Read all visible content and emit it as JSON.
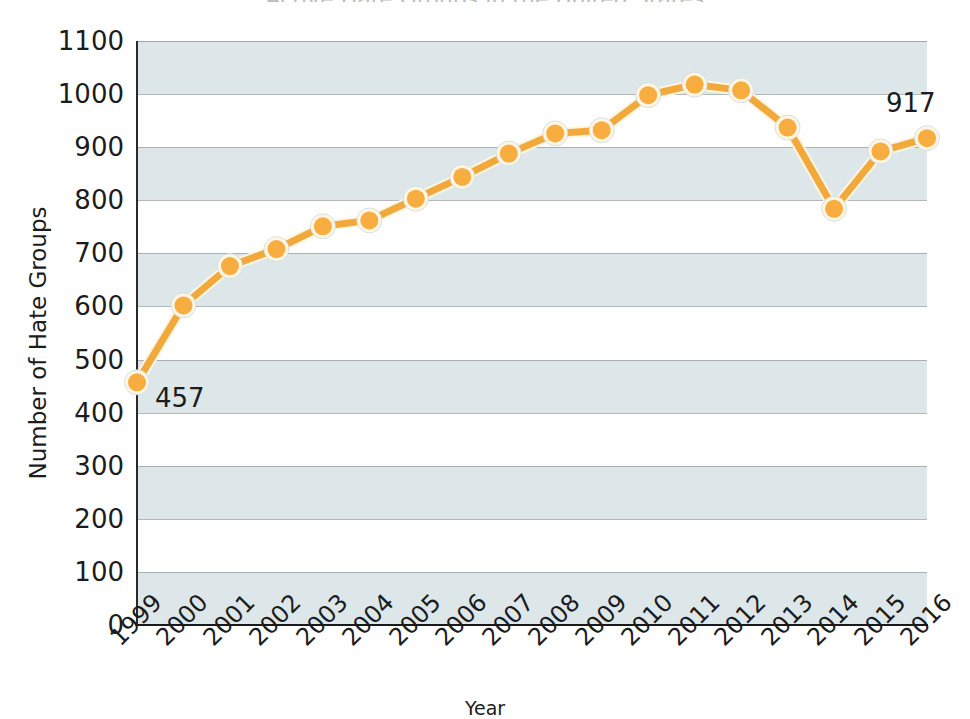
{
  "chart_data": {
    "type": "line",
    "title": "Active Hate Groups in the United States",
    "xlabel": "Year",
    "ylabel": "Number of Hate Groups",
    "categories": [
      "1999",
      "2000",
      "2001",
      "2002",
      "2003",
      "2004",
      "2005",
      "2006",
      "2007",
      "2008",
      "2009",
      "2010",
      "2011",
      "2012",
      "2013",
      "2014",
      "2015",
      "2016"
    ],
    "values": [
      457,
      602,
      676,
      708,
      751,
      762,
      803,
      844,
      888,
      926,
      932,
      998,
      1018,
      1007,
      937,
      784,
      892,
      917
    ],
    "ylim": [
      0,
      1100
    ],
    "ytick_step": 100,
    "yticks": [
      "0",
      "100",
      "200",
      "300",
      "400",
      "500",
      "600",
      "700",
      "800",
      "900",
      "1000",
      "1100"
    ],
    "grid": true,
    "grid_style": "horizontal alternating shaded bands",
    "legend": "none",
    "legend_position": "none",
    "series": [
      {
        "name": "Number of Hate Groups",
        "values": [
          457,
          602,
          676,
          708,
          751,
          762,
          803,
          844,
          888,
          926,
          932,
          998,
          1018,
          1007,
          937,
          784,
          892,
          917
        ]
      }
    ],
    "annotations": [
      {
        "name": "first-value-label",
        "text": "457",
        "category": "1999",
        "value": 457
      },
      {
        "name": "last-value-label",
        "text": "917",
        "category": "2016",
        "value": 917
      }
    ]
  },
  "colors": {
    "line": "#f2a93c",
    "marker_fill": "#f7ad3f",
    "marker_halo": "#fdf6e4",
    "band": "#dde7ea",
    "gridline": "#8a9296",
    "axis": "#1e1e1e",
    "text": "#1c1c1c",
    "plot_background": "#ffffff"
  }
}
